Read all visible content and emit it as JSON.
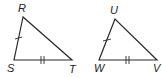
{
  "figures": [
    {
      "name": "triangle-RST",
      "vertices": {
        "top": "R",
        "bottom_left": "S",
        "bottom_right": "T"
      },
      "congruence_marks": {
        "RS": 1,
        "ST": 2
      }
    },
    {
      "name": "triangle-UWV",
      "vertices": {
        "top": "U",
        "bottom_left": "W",
        "bottom_right": "V"
      },
      "congruence_marks": {
        "UW": 1,
        "WV": 2
      }
    }
  ],
  "colors": {
    "stroke": "#2a2a2a",
    "label": "#222222",
    "background": "#ffffff"
  }
}
